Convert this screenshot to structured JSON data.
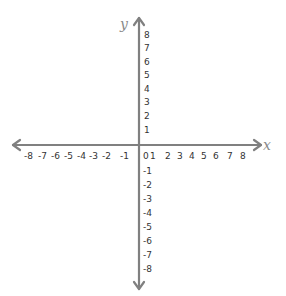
{
  "diagram": {
    "type": "coordinate-plane",
    "axis_color": "#808080",
    "label_color": "#333333",
    "x_axis": {
      "name": "x",
      "ticks": [
        "-8",
        "-7",
        "-6",
        "-5",
        "-4",
        "-3",
        "-2",
        "-1",
        "0",
        "1",
        "2",
        "3",
        "4",
        "5",
        "6",
        "7",
        "8"
      ],
      "range": [
        -8,
        8
      ]
    },
    "y_axis": {
      "name": "y",
      "ticks_positive": [
        "8",
        "7",
        "6",
        "5",
        "4",
        "3",
        "2",
        "1"
      ],
      "ticks_negative": [
        "-1",
        "-2",
        "-3",
        "-4",
        "-5",
        "-6",
        "-7",
        "-8"
      ],
      "range": [
        -8,
        8
      ]
    }
  }
}
